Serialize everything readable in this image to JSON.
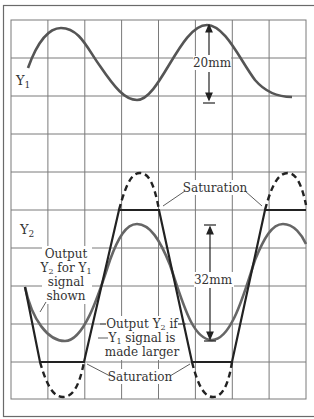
{
  "figure": {
    "grid": {
      "columns": 8,
      "rows": 10,
      "left": 11,
      "top": 20,
      "right": 306,
      "bottom": 399
    },
    "colors": {
      "grid": "#7a7a7a",
      "frame": "#6a6a6a",
      "y1_trace": "#555555",
      "y2_trace": "#666666",
      "large_trace": "#222222",
      "text": "#333333"
    }
  },
  "labels": {
    "y1": "Y",
    "y1_sub": "1",
    "y2": "Y",
    "y2_sub": "2",
    "amp_y1": "20mm",
    "amp_y2": "32mm",
    "saturation_top": "Saturation",
    "saturation_bottom": "Saturation",
    "output_shown": {
      "line1": "Output",
      "line2_a": "Y",
      "line2_sub1": "2",
      "line2_b": " for Y",
      "line2_sub2": "1",
      "line3": "signal",
      "line4": "shown"
    },
    "output_larger": {
      "line1_a": "Output Y",
      "line1_sub": "2",
      "line1_b": " if",
      "line2_a": "Y",
      "line2_sub": "1",
      "line2_b": " signal is",
      "line3": "made larger"
    }
  },
  "traces": {
    "y1_input": "Y1 input sine wave, amplitude 20mm peak-to-peak",
    "y2_output": "Y2 output sine wave, amplitude 32mm peak-to-peak",
    "y2_clipped": "Y2 output when Y1 is made larger, clipped at saturation levels"
  }
}
